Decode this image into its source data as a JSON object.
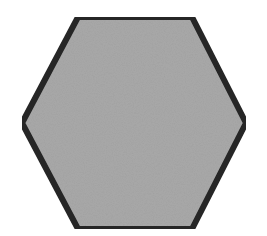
{
  "figure": {
    "shape": "hexagon",
    "fill_color": "#a9a9a9",
    "stroke_color": "#262626",
    "stroke_width": 6,
    "background_color": "#ffffff",
    "vertices": [
      [
        78,
        17
      ],
      [
        192,
        17
      ],
      [
        246,
        123
      ],
      [
        192,
        229
      ],
      [
        78,
        229
      ],
      [
        22,
        123
      ]
    ]
  }
}
